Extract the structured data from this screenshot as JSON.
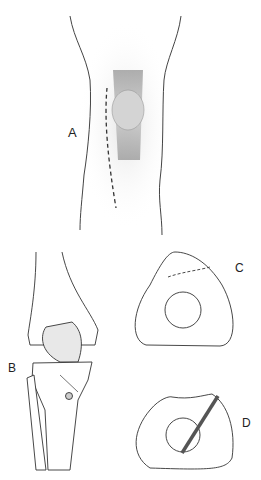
{
  "figure": {
    "panels": [
      {
        "id": "A",
        "label": "A",
        "description": "Anterior knee with patella and dashed incision line"
      },
      {
        "id": "B",
        "label": "B",
        "description": "Anterior knee bones with tendon fixed by screw to tibia"
      },
      {
        "id": "C",
        "label": "C",
        "description": "Cross-section of patella with dashed bone block outline"
      },
      {
        "id": "D",
        "label": "D",
        "description": "Cross-section with screw fixation through bone block"
      }
    ]
  }
}
